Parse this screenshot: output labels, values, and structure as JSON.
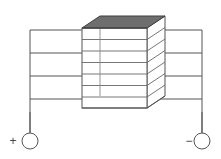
{
  "figure": {
    "title": "Isometric cell stack with positive and negative terminals",
    "type": "technical-line-diagram",
    "canvas": {
      "width": 221,
      "height": 159,
      "background": "#ffffff"
    }
  },
  "style": {
    "line_color": "#555555",
    "line_color_light": "#777777",
    "stack_face_color": "#ffffff",
    "stack_top_color": "#6e6e6e",
    "stack_top_edge_color": "#3f3f3f",
    "terminal_stroke": "#555555",
    "terminal_fill": "#ffffff",
    "sign_color": "#444444",
    "stroke_width": 1,
    "stroke_width_thin": 0.9
  },
  "stack": {
    "name": "cell-stack",
    "layer_count": 7,
    "top_plate_label": "top-plate",
    "geometry": {
      "front_left_x": 82,
      "front_right_x": 147,
      "front_top_y": 28,
      "front_bottom_y": 108,
      "iso_dx": 18,
      "iso_dy": -12,
      "layer_ys": [
        28,
        39.5,
        51,
        62.5,
        74,
        85.5,
        97,
        108
      ]
    },
    "top_face": {
      "points": [
        {
          "x": 82,
          "y": 28
        },
        {
          "x": 100,
          "y": 16
        },
        {
          "x": 165,
          "y": 16
        },
        {
          "x": 147,
          "y": 28
        }
      ]
    }
  },
  "wiring": {
    "left": {
      "name": "positive-bus",
      "bus_x": 30,
      "bus_top_y": 30,
      "bus_bottom_y": 133,
      "branch_xs": {
        "from": 30,
        "to": 82
      },
      "branch_ys": [
        30,
        53,
        76,
        99
      ]
    },
    "right": {
      "name": "negative-bus",
      "bus_x": 202,
      "bus_top_y": 30,
      "bus_bottom_y": 133,
      "branch_xs": {
        "from": 165,
        "to": 202
      },
      "branch_ys": [
        30,
        53,
        76,
        99
      ]
    }
  },
  "terminals": [
    {
      "id": "terminal-positive",
      "name": "positive-terminal",
      "sign": "+",
      "sign_x": 13,
      "sign_y": 141,
      "circle": {
        "cx": 30,
        "cy": 141,
        "r": 8
      },
      "lead_x": 30,
      "lead_top_y": 112,
      "lead_bottom_y": 133
    },
    {
      "id": "terminal-negative",
      "name": "negative-terminal",
      "sign": "−",
      "sign_x": 189,
      "sign_y": 141,
      "circle": {
        "cx": 202,
        "cy": 141,
        "r": 8
      },
      "lead_x": 202,
      "lead_top_y": 112,
      "lead_bottom_y": 133
    }
  ],
  "labels": {
    "positive_sign": "+",
    "negative_sign": "−",
    "figure_caption": ""
  }
}
